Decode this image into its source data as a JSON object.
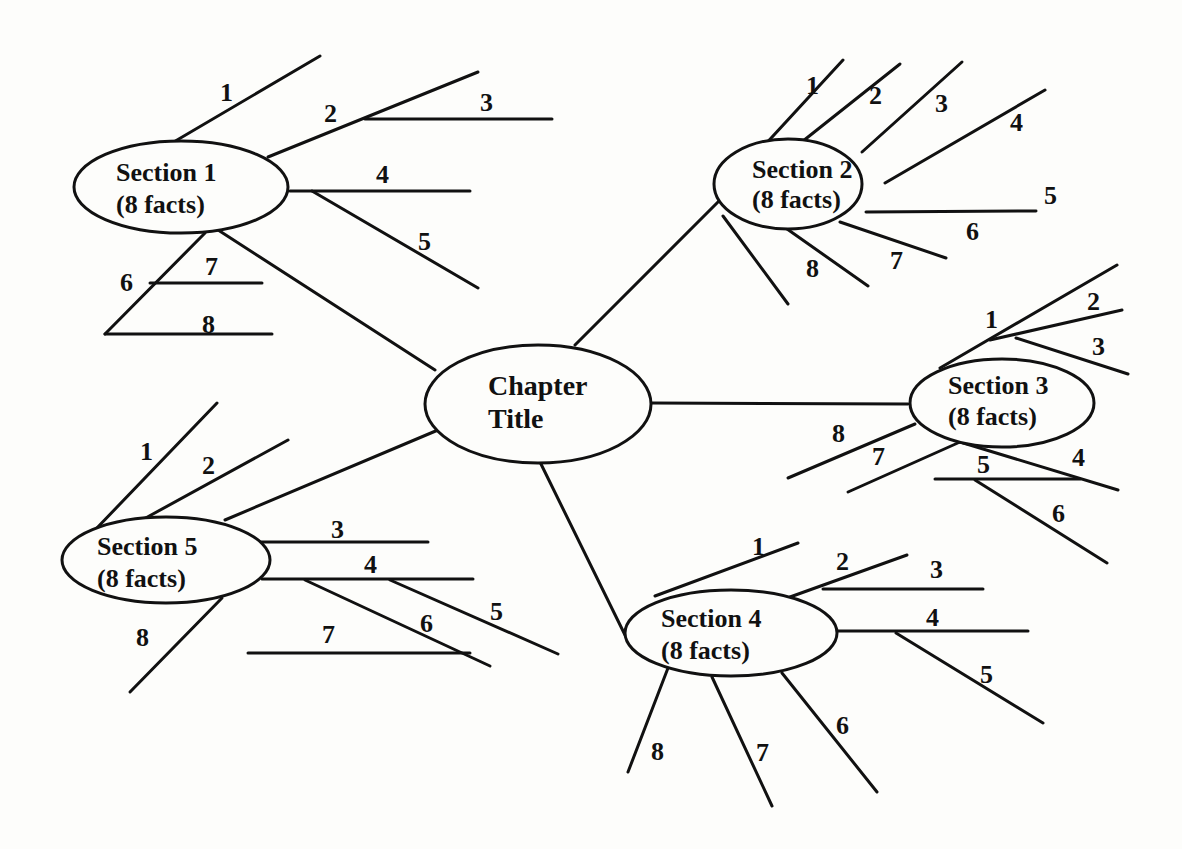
{
  "center": {
    "line1": "Chapter",
    "line2": "Title"
  },
  "sections": [
    {
      "title": "Section 1",
      "subtitle": "(8 facts)",
      "facts": [
        "1",
        "2",
        "3",
        "4",
        "5",
        "6",
        "7",
        "8"
      ]
    },
    {
      "title": "Section 2",
      "subtitle": "(8 facts)",
      "facts": [
        "1",
        "2",
        "3",
        "4",
        "5",
        "6",
        "7",
        "8"
      ]
    },
    {
      "title": "Section 3",
      "subtitle": "(8 facts)",
      "facts": [
        "1",
        "2",
        "3",
        "4",
        "5",
        "6",
        "7",
        "8"
      ]
    },
    {
      "title": "Section 4",
      "subtitle": "(8 facts)",
      "facts": [
        "1",
        "2",
        "3",
        "4",
        "5",
        "6",
        "7",
        "8"
      ]
    },
    {
      "title": "Section 5",
      "subtitle": "(8 facts)",
      "facts": [
        "1",
        "2",
        "3",
        "4",
        "5",
        "6",
        "7",
        "8"
      ]
    }
  ],
  "colors": {
    "ink": "#111111",
    "paper": "#fdfdfb"
  }
}
